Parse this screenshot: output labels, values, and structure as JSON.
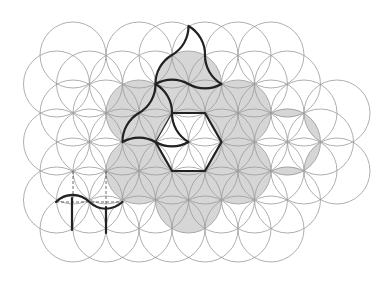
{
  "figure": {
    "width": 390,
    "height": 283,
    "radius": 33,
    "colors": {
      "background": "#ffffff",
      "circle_stroke": "#9a9a9a",
      "shade_fill": "#d6d6d6",
      "bold_stroke": "#222222"
    },
    "circle_rows": [
      {
        "y": 55,
        "xs": [
          73,
          139,
          172,
          205,
          238,
          271
        ]
      },
      {
        "y": 84,
        "xs": [
          56.5,
          89.5,
          122.5,
          155.5,
          188.5,
          221.5,
          254.5,
          287.5
        ]
      },
      {
        "y": 113,
        "xs": [
          73,
          106,
          139,
          172,
          205,
          238,
          271,
          304,
          337
        ]
      },
      {
        "y": 142,
        "xs": [
          56.5,
          89.5,
          122.5,
          155.5,
          188.5,
          221.5,
          254.5,
          287.5,
          320.5
        ]
      },
      {
        "y": 171,
        "xs": [
          73,
          106,
          139,
          172,
          205,
          238,
          271,
          304,
          337
        ]
      },
      {
        "y": 200,
        "xs": [
          56.5,
          89.5,
          122.5,
          155.5,
          188.5,
          221.5,
          254.5,
          287.5
        ]
      },
      {
        "y": 229,
        "xs": [
          73,
          106,
          139,
          172,
          205,
          238,
          271
        ]
      }
    ],
    "shaded_circles": [
      [
        188.5,
        84
      ],
      [
        238,
        113
      ],
      [
        238,
        171
      ],
      [
        188.5,
        200
      ],
      [
        139,
        171
      ],
      [
        139,
        113
      ]
    ],
    "shaded_lenses": [
      [
        [
          271,
          113
        ],
        [
          304,
          113
        ]
      ],
      [
        [
          304,
          113
        ],
        [
          320.5,
          142
        ]
      ],
      [
        [
          320.5,
          142
        ],
        [
          304,
          171
        ]
      ],
      [
        [
          304,
          171
        ],
        [
          271,
          171
        ]
      ]
    ],
    "white_hexagon": [
      [
        172,
        113
      ],
      [
        205,
        113
      ],
      [
        221.5,
        142
      ],
      [
        205,
        171
      ],
      [
        172,
        171
      ],
      [
        155.5,
        142
      ]
    ],
    "bold_paths": [
      "M188.5,26 A33,33 0 0 1 205,55 A33,33 0 0 0 221.5,84 A33,33 0 0 1 188.5,84 A33,33 0 0 0 155.5,84 A33,33 0 0 1 172,55 A33,33 0 0 0 188.5,26",
      "M155.5,84 A33,33 0 0 1 172,113 A33,33 0 0 0 188.5,142 A33,33 0 0 1 155.5,142 A33,33 0 0 0 122.5,142 A33,33 0 0 1 139,113 A33,33 0 0 0 155.5,84",
      "M172,113 L205,113 L221.5,142 L205,171 L172,171 L155.5,142",
      "M56,202 C66,192 80,193 89.5,202 C99,211 112,211 122.5,202",
      "M72,198 L72,230",
      "M106,207 L106,233"
    ],
    "medium_paths": [
      "M155.5,142 L172,113"
    ],
    "dashed_paths": [
      "M73,171 L73,198",
      "M106,171 L106,207",
      "M56,202 L122.5,202"
    ]
  }
}
